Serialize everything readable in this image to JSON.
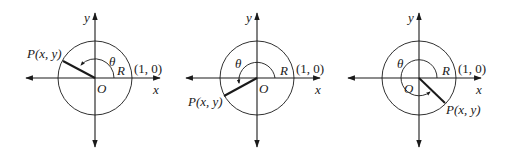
{
  "figure": {
    "colors": {
      "stroke": "#1a1a1a",
      "background": "#ffffff"
    },
    "panels": [
      {
        "id": "quadrant-2",
        "labels": {
          "y_axis": "y",
          "x_axis": "x",
          "origin": "O",
          "angle": "θ",
          "radius": "R",
          "unit_point": "(1, 0)",
          "point": "P(x, y)"
        }
      },
      {
        "id": "quadrant-3",
        "labels": {
          "y_axis": "y",
          "x_axis": "x",
          "origin": "O",
          "angle": "θ",
          "radius": "R",
          "unit_point": "(1, 0)",
          "point": "P(x, y)"
        }
      },
      {
        "id": "quadrant-4",
        "labels": {
          "y_axis": "y",
          "x_axis": "x",
          "origin": "O",
          "angle": "θ",
          "radius": "R",
          "unit_point": "(1, 0)",
          "point": "P(x, y)"
        }
      }
    ]
  }
}
